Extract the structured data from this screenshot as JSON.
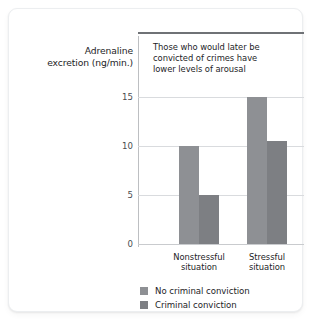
{
  "chart_data": {
    "type": "bar",
    "title": "",
    "annotation": "Those who would later be convicted of crimes have lower levels of arousal",
    "annotation_lines": [
      "Those who would later be",
      "convicted of crimes have",
      "lower levels of arousal"
    ],
    "xlabel": "",
    "ylabel": "Adrenaline excretion (ng/min.)",
    "ylabel_lines": [
      "Adrenaline",
      "excretion (ng/min.)"
    ],
    "categories": [
      "Nonstressful situation",
      "Stressful situation"
    ],
    "category_lines": [
      [
        "Nonstressful",
        "situation"
      ],
      [
        "Stressful",
        "situation"
      ]
    ],
    "series": [
      {
        "name": "No criminal conviction",
        "color": "#8e9094",
        "values": [
          10,
          15
        ]
      },
      {
        "name": "Criminal conviction",
        "color": "#7d7f83",
        "values": [
          5,
          10.5
        ]
      }
    ],
    "ylim": [
      0,
      15
    ],
    "yticks": [
      0,
      5,
      10,
      15
    ],
    "ytick_labels": [
      "0",
      "5",
      "10",
      "15"
    ],
    "grid": true,
    "legend_position": "bottom-left"
  },
  "legend": {
    "items": [
      {
        "label": "No criminal conviction",
        "color": "#8e9094"
      },
      {
        "label": "Criminal conviction",
        "color": "#7d7f83"
      }
    ]
  }
}
